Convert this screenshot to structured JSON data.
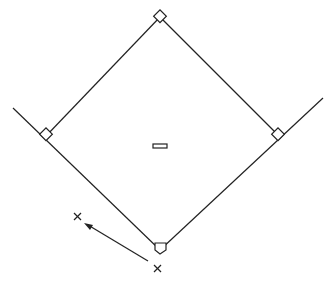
{
  "diagram": {
    "stroke_color": "#222222",
    "background": "#ffffff",
    "elements": {
      "second_base": "second-base",
      "first_base": "first-base",
      "third_base": "third-base",
      "pitchers_rubber": "pitchers-rubber",
      "home_plate": "home-plate",
      "catcher": "catcher-x-marker",
      "runner": "runner-x-marker",
      "arrow": "throw-arrow"
    }
  }
}
